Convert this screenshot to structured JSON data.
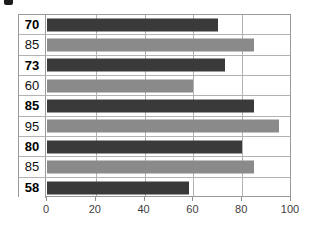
{
  "chart_data": {
    "type": "bar",
    "orientation": "horizontal",
    "title": "",
    "xlabel": "",
    "ylabel": "",
    "xlim": [
      0,
      100
    ],
    "xticks": [
      0,
      20,
      40,
      60,
      80,
      100
    ],
    "xtick_labels": [
      "0",
      "20",
      "40",
      "60",
      "80",
      "100"
    ],
    "grid": true,
    "legend": false,
    "categories": [
      "70",
      "85",
      "73",
      "60",
      "85",
      "95",
      "80",
      "85",
      "58"
    ],
    "values": [
      70,
      85,
      73,
      60,
      85,
      95,
      80,
      85,
      58
    ],
    "bars": [
      {
        "label": "70",
        "value": 70,
        "color": "#3a3a3a",
        "bold_label": true
      },
      {
        "label": "85",
        "value": 85,
        "color": "#8a8a8a",
        "bold_label": false
      },
      {
        "label": "73",
        "value": 73,
        "color": "#3a3a3a",
        "bold_label": true
      },
      {
        "label": "60",
        "value": 60,
        "color": "#8a8a8a",
        "bold_label": false
      },
      {
        "label": "85",
        "value": 85,
        "color": "#3a3a3a",
        "bold_label": true
      },
      {
        "label": "95",
        "value": 95,
        "color": "#8a8a8a",
        "bold_label": false
      },
      {
        "label": "80",
        "value": 80,
        "color": "#3a3a3a",
        "bold_label": true
      },
      {
        "label": "85",
        "value": 85,
        "color": "#8a8a8a",
        "bold_label": false
      },
      {
        "label": "58",
        "value": 58,
        "color": "#3a3a3a",
        "bold_label": true
      }
    ],
    "colors": {
      "dark_series": "#3a3a3a",
      "light_series": "#8a8a8a",
      "gridline": "#b2b2b2",
      "frame": "#9a9a9a",
      "tick_label": "#3d3d3d"
    }
  }
}
